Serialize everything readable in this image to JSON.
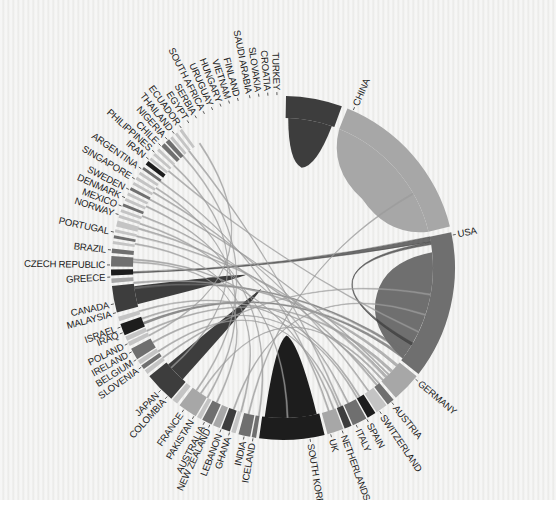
{
  "diagram": {
    "center": [
      283,
      268
    ],
    "outer_radius": 172,
    "inner_radius": 150,
    "label_radius": 176
  },
  "colors": {
    "dark": "#3d3d3d",
    "mid": "#6f6f6f",
    "light": "#a7a7a7",
    "pale": "#c4c4c4",
    "black": "#1d1d1d",
    "chord": "#9c9c9c"
  },
  "chart_data": {
    "type": "chord",
    "title": "",
    "nodes": [
      {
        "name": "CHINA",
        "start": 22,
        "end": 76,
        "color": "light",
        "label_angle": 24
      },
      {
        "name": "USA",
        "start": 78,
        "end": 128,
        "color": "mid",
        "label_angle": 79
      },
      {
        "name": "GERMANY",
        "start": 129,
        "end": 139,
        "color": "light",
        "label_angle": 130
      },
      {
        "name": "AUSTRIA",
        "start": 140,
        "end": 142.5,
        "color": "mid",
        "label_angle": 141
      },
      {
        "name": "SWITZERLAND",
        "start": 143,
        "end": 147,
        "color": "pale",
        "label_angle": 146
      },
      {
        "name": "SPAIN",
        "start": 147.5,
        "end": 150.5,
        "color": "black",
        "label_angle": 151
      },
      {
        "name": "ITALY",
        "start": 151,
        "end": 156,
        "color": "mid",
        "label_angle": 155
      },
      {
        "name": "NETHERLANDS",
        "start": 156.5,
        "end": 159,
        "color": "dark",
        "label_angle": 160
      },
      {
        "name": "UK",
        "start": 159.5,
        "end": 165,
        "color": "light",
        "label_angle": 164
      },
      {
        "name": "SOUTH KOREA",
        "start": 166,
        "end": 188,
        "color": "black",
        "label_angle": 171
      },
      {
        "name": "ICELAND",
        "start": 189,
        "end": 190.5,
        "color": "mid",
        "label_angle": 190
      },
      {
        "name": "INDIA",
        "start": 191,
        "end": 195,
        "color": "mid",
        "label_angle": 193
      },
      {
        "name": "GHANA",
        "start": 196,
        "end": 197.5,
        "color": "pale",
        "label_angle": 198
      },
      {
        "name": "LEBANON",
        "start": 198,
        "end": 201,
        "color": "dark",
        "label_angle": 201
      },
      {
        "name": "NEW ZEALAND",
        "start": 201.5,
        "end": 204,
        "color": "light",
        "label_angle": 205
      },
      {
        "name": "AUSTRALIA",
        "start": 204.5,
        "end": 208,
        "color": "mid",
        "label_angle": 207
      },
      {
        "name": "PAKISTAN",
        "start": 208.5,
        "end": 210,
        "color": "pale",
        "label_angle": 211
      },
      {
        "name": "FRANCE",
        "start": 210.5,
        "end": 217,
        "color": "light",
        "label_angle": 215
      },
      {
        "name": "COLOMBIA",
        "start": 218,
        "end": 220,
        "color": "pale",
        "label_angle": 222
      },
      {
        "name": "JAPAN",
        "start": 220.5,
        "end": 231,
        "color": "dark",
        "label_angle": 225
      },
      {
        "name": "SLOVENIA",
        "start": 232,
        "end": 233.5,
        "color": "pale",
        "label_angle": 235
      },
      {
        "name": "BELGIUM",
        "start": 234,
        "end": 235.5,
        "color": "mid",
        "label_angle": 238
      },
      {
        "name": "IRELAND",
        "start": 236,
        "end": 237.5,
        "color": "pale",
        "label_angle": 241
      },
      {
        "name": "POLAND",
        "start": 238,
        "end": 242,
        "color": "mid",
        "label_angle": 244
      },
      {
        "name": "IRAQ",
        "start": 243,
        "end": 244.5,
        "color": "pale",
        "label_angle": 248
      },
      {
        "name": "ISRAEL",
        "start": 245,
        "end": 246.5,
        "color": "pale",
        "label_angle": 250
      },
      {
        "name": "MALAYSIA",
        "start": 247,
        "end": 251,
        "color": "black",
        "label_angle": 255
      },
      {
        "name": "CANADA",
        "start": 252,
        "end": 253.5,
        "color": "pale",
        "label_angle": 258
      },
      {
        "name": "",
        "start": 255,
        "end": 264,
        "color": "dark",
        "label_angle": 260
      },
      {
        "name": "GREECE",
        "start": 265,
        "end": 266.5,
        "color": "light",
        "label_angle": 267
      },
      {
        "name": "CZECH REPUBLIC",
        "start": 267.5,
        "end": 269.5,
        "color": "black",
        "label_angle": 271
      },
      {
        "name": "BRAZIL",
        "start": 270.5,
        "end": 274,
        "color": "mid",
        "label_angle": 276
      },
      {
        "name": "PORTUGAL",
        "start": 275,
        "end": 276.5,
        "color": "mid",
        "label_angle": 282
      },
      {
        "name": "NORWAY",
        "start": 278,
        "end": 279,
        "color": "pale",
        "label_angle": 288
      },
      {
        "name": "MEXICO",
        "start": 280,
        "end": 281,
        "color": "mid",
        "label_angle": 291
      },
      {
        "name": "DENMARK",
        "start": 282,
        "end": 283,
        "color": "pale",
        "label_angle": 294
      },
      {
        "name": "SWEDEN",
        "start": 284,
        "end": 286,
        "color": "pale",
        "label_angle": 297
      },
      {
        "name": "SINGAPORE",
        "start": 287,
        "end": 288,
        "color": "pale",
        "label_angle": 301
      },
      {
        "name": "ARGENTINA",
        "start": 289,
        "end": 290,
        "color": "pale",
        "label_angle": 305
      },
      {
        "name": "IRAN",
        "start": 291,
        "end": 292,
        "color": "mid",
        "label_angle": 309
      },
      {
        "name": "PHILIPPINES",
        "start": 293,
        "end": 294,
        "color": "pale",
        "label_angle": 312
      },
      {
        "name": "CHILE",
        "start": 295,
        "end": 296,
        "color": "pale",
        "label_angle": 315
      },
      {
        "name": "NIGERIA",
        "start": 297,
        "end": 298,
        "color": "mid",
        "label_angle": 318
      },
      {
        "name": "THAILAND",
        "start": 299,
        "end": 300,
        "color": "pale",
        "label_angle": 321
      },
      {
        "name": "ECUADOR",
        "start": 301,
        "end": 302,
        "color": "pale",
        "label_angle": 324
      },
      {
        "name": "EGYPT",
        "start": 303,
        "end": 304,
        "color": "pale",
        "label_angle": 327
      },
      {
        "name": "SERBIA",
        "start": 305,
        "end": 306,
        "color": "mid",
        "label_angle": 330
      },
      {
        "name": "SOUTH AFRICA",
        "start": 307,
        "end": 308.5,
        "color": "black",
        "label_angle": 333
      },
      {
        "name": "URUGUAY",
        "start": 309,
        "end": 310,
        "color": "pale",
        "label_angle": 336
      },
      {
        "name": "HUNGARY",
        "start": 311,
        "end": 312,
        "color": "pale",
        "label_angle": 339
      },
      {
        "name": "VIETNAM",
        "start": 313,
        "end": 314,
        "color": "pale",
        "label_angle": 342
      },
      {
        "name": "FINLAND",
        "start": 315,
        "end": 316.5,
        "color": "mid",
        "label_angle": 345
      },
      {
        "name": "SAUDI ARABIA",
        "start": 317,
        "end": 318.5,
        "color": "mid",
        "label_angle": 349
      },
      {
        "name": "SLOVAKIA",
        "start": 319,
        "end": 320,
        "color": "pale",
        "label_angle": 352
      },
      {
        "name": "CROATIA",
        "start": 321,
        "end": 322,
        "color": "pale",
        "label_angle": 355
      },
      {
        "name": "TURKEY",
        "start": 323,
        "end": 324,
        "color": "pale",
        "label_angle": 358
      },
      {
        "name": "",
        "start": 1,
        "end": 20,
        "color": "dark",
        "label_angle": 10
      }
    ],
    "chords": [
      {
        "from": [
          2,
          19
        ],
        "to": [
          2,
          19
        ],
        "self": true,
        "color": "dark",
        "depth": 0.32
      },
      {
        "from": [
          22,
          76
        ],
        "to": [
          22,
          76
        ],
        "self": true,
        "color": "light",
        "depth": 0.3
      },
      {
        "from": [
          84,
          127
        ],
        "to": [
          84,
          127
        ],
        "self": true,
        "color": "mid",
        "depth": 0.35
      },
      {
        "from": [
          167,
          187
        ],
        "to": [
          167,
          187
        ],
        "self": true,
        "color": "black",
        "depth": 0.55
      },
      {
        "from": [
          222,
          230
        ],
        "to": [
          222,
          230
        ],
        "self": true,
        "color": "dark",
        "depth": 0.8
      },
      {
        "from": [
          256,
          263
        ],
        "to": [
          256,
          263
        ],
        "self": true,
        "color": "dark",
        "depth": 0.75
      },
      {
        "from": [
          78,
          80
        ],
        "to": [
          268,
          268.6
        ],
        "color": "dark"
      },
      {
        "from": [
          80,
          81
        ],
        "to": [
          120,
          121
        ],
        "color": "dark"
      },
      {
        "from": [
          124,
          125
        ],
        "to": [
          262,
          262.6
        ],
        "color": "mid"
      },
      {
        "from": [
          126,
          127
        ],
        "to": [
          248,
          248.8
        ],
        "color": "mid"
      },
      {
        "from": [
          130,
          131
        ],
        "to": [
          264,
          264.6
        ],
        "color": "chord"
      },
      {
        "from": [
          133,
          134
        ],
        "to": [
          245,
          245.5
        ],
        "color": "chord"
      },
      {
        "from": [
          136,
          137
        ],
        "to": [
          282,
          282.5
        ],
        "color": "chord"
      },
      {
        "from": [
          138,
          138.6
        ],
        "to": [
          213,
          213.5
        ],
        "color": "chord"
      },
      {
        "from": [
          141,
          141.6
        ],
        "to": [
          285,
          285.6
        ],
        "color": "chord"
      },
      {
        "from": [
          145,
          145.5
        ],
        "to": [
          300,
          300.5
        ],
        "color": "chord"
      },
      {
        "from": [
          149,
          149.5
        ],
        "to": [
          253,
          253.5
        ],
        "color": "chord"
      },
      {
        "from": [
          154,
          154.5
        ],
        "to": [
          290,
          290.5
        ],
        "color": "chord"
      },
      {
        "from": [
          158,
          158.5
        ],
        "to": [
          236,
          236.5
        ],
        "color": "chord"
      },
      {
        "from": [
          162,
          162.5
        ],
        "to": [
          305,
          305.5
        ],
        "color": "chord"
      },
      {
        "from": [
          189,
          189.5
        ],
        "to": [
          294,
          294.5
        ],
        "color": "chord"
      },
      {
        "from": [
          193,
          193.5
        ],
        "to": [
          60,
          60.5
        ],
        "color": "chord"
      },
      {
        "from": [
          199,
          199.5
        ],
        "to": [
          108,
          108.5
        ],
        "color": "chord"
      },
      {
        "from": [
          206,
          206.5
        ],
        "to": [
          272,
          272.5
        ],
        "color": "chord"
      },
      {
        "from": [
          215,
          215.5
        ],
        "to": [
          318,
          318.5
        ],
        "color": "chord"
      },
      {
        "from": [
          233,
          233.5
        ],
        "to": [
          100,
          100.5
        ],
        "color": "chord"
      },
      {
        "from": [
          240,
          240.5
        ],
        "to": [
          150,
          150.5
        ],
        "color": "chord"
      },
      {
        "from": [
          243,
          243.5
        ],
        "to": [
          326,
          326.5
        ],
        "color": "chord"
      },
      {
        "from": [
          250,
          250.5
        ],
        "to": [
          140,
          140.5
        ],
        "color": "chord"
      },
      {
        "from": [
          273,
          273.5
        ],
        "to": [
          160,
          160.5
        ],
        "color": "chord"
      },
      {
        "from": [
          279,
          279.5
        ],
        "to": [
          196,
          196.5
        ],
        "color": "chord"
      },
      {
        "from": [
          287,
          287.5
        ],
        "to": [
          178,
          178.5
        ],
        "color": "chord"
      },
      {
        "from": [
          297,
          297.5
        ],
        "to": [
          135,
          135.5
        ],
        "color": "chord"
      },
      {
        "from": [
          302,
          302.5
        ],
        "to": [
          210,
          210.5
        ],
        "color": "chord"
      },
      {
        "from": [
          310,
          310.5
        ],
        "to": [
          115,
          115.5
        ],
        "color": "chord"
      },
      {
        "from": [
          313,
          313.5
        ],
        "to": [
          228,
          228.5
        ],
        "color": "chord"
      },
      {
        "from": [
          321,
          321.5
        ],
        "to": [
          157,
          157.5
        ],
        "color": "chord"
      }
    ]
  },
  "caption": ""
}
